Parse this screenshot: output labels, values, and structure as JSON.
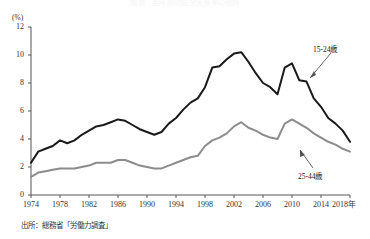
{
  "title": "図表　若年層の完全失業率の推移",
  "axis": {
    "y_unit": "(%)",
    "y_ticks": [
      "0",
      "2",
      "4",
      "6",
      "8",
      "10",
      "12"
    ],
    "x_ticks": [
      "1974",
      "1978",
      "1982",
      "1986",
      "1990",
      "1994",
      "1998",
      "2002",
      "2006",
      "2010",
      "2014",
      "2018年"
    ]
  },
  "source": "出所：総務省「労働力調査」",
  "annotations": {
    "series1": "15-24歳",
    "series2": "25-44歳"
  },
  "colors": {
    "series1": "#1a1a1a",
    "series2": "#8c8c8c",
    "axis": "#555555",
    "text": "#333333"
  },
  "chart_data": {
    "type": "line",
    "title": "図表　若年層の完全失業率の推移",
    "xlabel": "",
    "ylabel": "(%)",
    "xlim": [
      1974,
      2018
    ],
    "ylim": [
      0,
      12
    ],
    "grid": false,
    "legend": "annotated-inline",
    "x": [
      1974,
      1975,
      1976,
      1977,
      1978,
      1979,
      1980,
      1981,
      1982,
      1983,
      1984,
      1985,
      1986,
      1987,
      1988,
      1989,
      1990,
      1991,
      1992,
      1993,
      1994,
      1995,
      1996,
      1997,
      1998,
      1999,
      2000,
      2001,
      2002,
      2003,
      2004,
      2005,
      2006,
      2007,
      2008,
      2009,
      2010,
      2011,
      2012,
      2013,
      2014,
      2015,
      2016,
      2017,
      2018
    ],
    "series": [
      {
        "name": "15-24歳",
        "color": "#1a1a1a",
        "values": [
          2.3,
          3.1,
          3.3,
          3.5,
          3.9,
          3.7,
          3.9,
          4.3,
          4.6,
          4.9,
          5.0,
          5.2,
          5.4,
          5.3,
          5.0,
          4.7,
          4.5,
          4.3,
          4.5,
          5.1,
          5.5,
          6.1,
          6.6,
          6.9,
          7.7,
          9.1,
          9.2,
          9.7,
          10.1,
          10.2,
          9.5,
          8.7,
          8.0,
          7.7,
          7.2,
          9.1,
          9.4,
          8.2,
          8.1,
          6.9,
          6.3,
          5.5,
          5.1,
          4.6,
          3.8
        ]
      },
      {
        "name": "25-44歳",
        "color": "#8c8c8c",
        "values": [
          1.3,
          1.6,
          1.7,
          1.8,
          1.9,
          1.9,
          1.9,
          2.0,
          2.1,
          2.3,
          2.3,
          2.3,
          2.5,
          2.5,
          2.3,
          2.1,
          2.0,
          1.9,
          1.9,
          2.1,
          2.3,
          2.5,
          2.7,
          2.8,
          3.5,
          3.9,
          4.1,
          4.4,
          4.9,
          5.2,
          4.8,
          4.6,
          4.3,
          4.1,
          4.0,
          5.1,
          5.4,
          5.1,
          4.8,
          4.4,
          4.1,
          3.8,
          3.6,
          3.3,
          3.1
        ]
      }
    ]
  }
}
